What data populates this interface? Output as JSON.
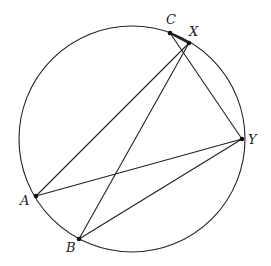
{
  "diagram": {
    "points": [
      {
        "id": "A",
        "label": "A"
      },
      {
        "id": "B",
        "label": "B"
      },
      {
        "id": "C",
        "label": "C"
      },
      {
        "id": "X",
        "label": "X"
      },
      {
        "id": "Y",
        "label": "Y"
      }
    ],
    "segments": [
      {
        "from": "A",
        "to": "X",
        "emphasis": false
      },
      {
        "from": "B",
        "to": "X",
        "emphasis": false
      },
      {
        "from": "C",
        "to": "Y",
        "emphasis": false
      },
      {
        "from": "A",
        "to": "Y",
        "emphasis": false
      },
      {
        "from": "B",
        "to": "Y",
        "emphasis": false
      },
      {
        "from": "C",
        "to": "X",
        "emphasis": true
      }
    ],
    "colors": {
      "stroke": "#222222",
      "point": "#111111",
      "background": "#ffffff"
    }
  }
}
